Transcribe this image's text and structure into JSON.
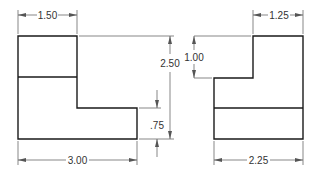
{
  "drawing": {
    "type": "orthographic-views",
    "views": [
      {
        "name": "front-view",
        "dimensions": {
          "top_width": "1.50",
          "overall_width": "3.00",
          "overall_height": "2.50",
          "step_height": ".75"
        }
      },
      {
        "name": "side-view",
        "dimensions": {
          "top_width": "1.25",
          "overall_width": "2.25",
          "step_height": "1.00"
        }
      }
    ]
  },
  "labels": {
    "front_top_width": "1.50",
    "front_overall_width": "3.00",
    "front_overall_height": "2.50",
    "front_step_height": ".75",
    "side_top_width": "1.25",
    "side_overall_width": "2.25",
    "side_step_height": "1.00"
  },
  "colors": {
    "object_line": "#1a1a1a",
    "dimension_line": "#555555",
    "background": "#ffffff"
  }
}
